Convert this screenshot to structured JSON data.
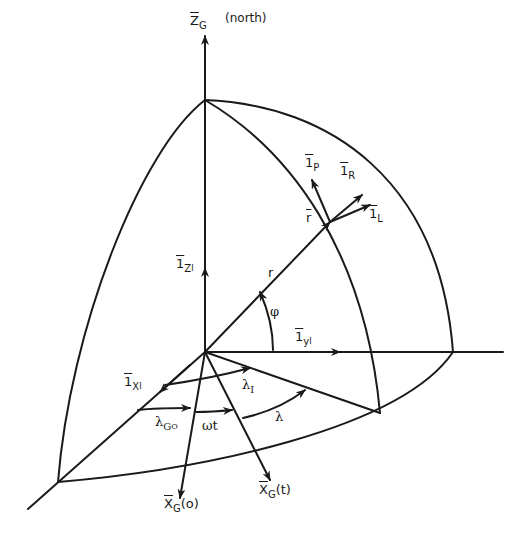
{
  "diagram": {
    "colors": {
      "ink": "#1a1a1a",
      "background": "#ffffff"
    },
    "labels": {
      "zg": {
        "main": "Z",
        "sub": "G",
        "note": "(north)"
      },
      "ip": {
        "main": "1",
        "sub": "P"
      },
      "ir": {
        "main": "1",
        "sub": "R"
      },
      "il": {
        "main": "1",
        "sub": "L"
      },
      "rvec": {
        "main": "r"
      },
      "izi": {
        "main": "1",
        "sub": "Z",
        "subsub": "I"
      },
      "r": {
        "main": "r"
      },
      "phi": {
        "main": "φ"
      },
      "iyi": {
        "main": "1",
        "sub": "y",
        "subsub": "I"
      },
      "ixi": {
        "main": "1",
        "sub": "X",
        "subsub": "I"
      },
      "lambdaI": {
        "main": "λ",
        "sub": "I"
      },
      "lambdaGO": {
        "main": "λ",
        "sub": "G",
        "subsub": "O"
      },
      "omegat": {
        "main": "ωt"
      },
      "lambda": {
        "main": "λ"
      },
      "xg0": {
        "main": "X",
        "sub": "G",
        "tail": "(o)"
      },
      "xgt": {
        "main": "X",
        "sub": "G",
        "tail": "(t)"
      }
    }
  }
}
